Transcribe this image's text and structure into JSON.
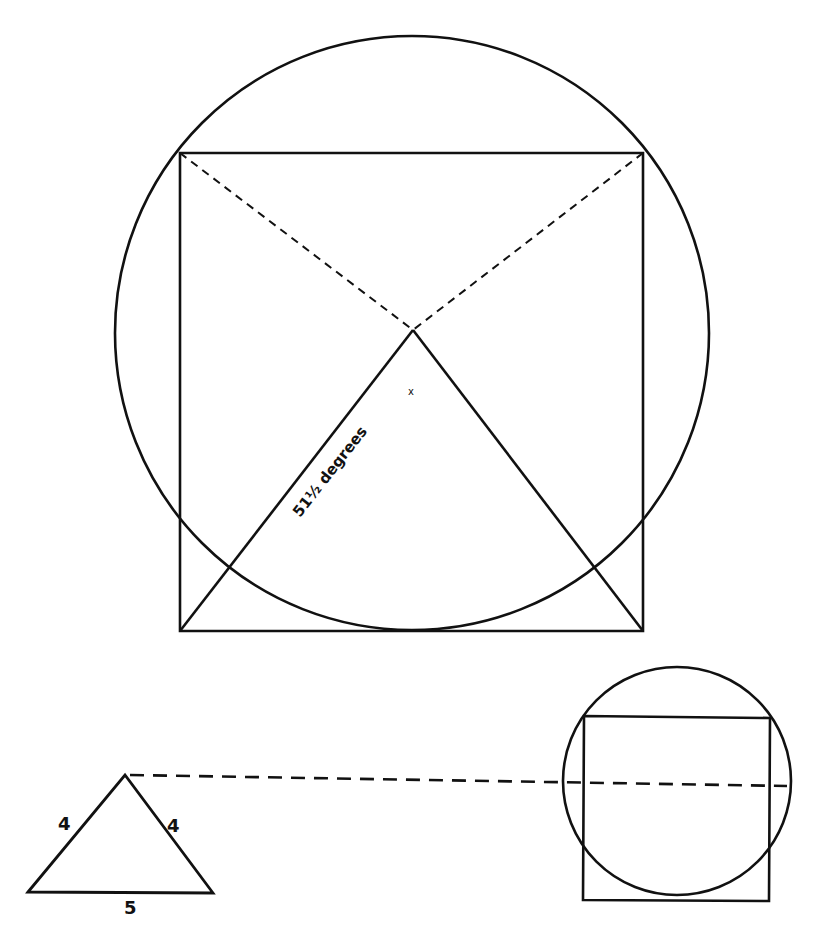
{
  "diagram": {
    "stroke_color": "#111111",
    "background": "#ffffff",
    "main": {
      "circle": {
        "cx": 412,
        "cy": 333,
        "r": 297
      },
      "square": {
        "x1": 180,
        "y1": 153,
        "x2": 643,
        "y2": 631
      },
      "apex": {
        "x": 413,
        "y": 330
      },
      "center_mark": "x",
      "angle_label": "51½ degrees"
    },
    "triangle": {
      "left_side_label": "4",
      "right_side_label": "4",
      "base_label": "5"
    },
    "small": {
      "circle": {
        "cx": 677,
        "cy": 781,
        "r": 114
      },
      "square": {
        "x1": 584,
        "y1": 716,
        "x2": 769,
        "y2": 901
      }
    }
  }
}
